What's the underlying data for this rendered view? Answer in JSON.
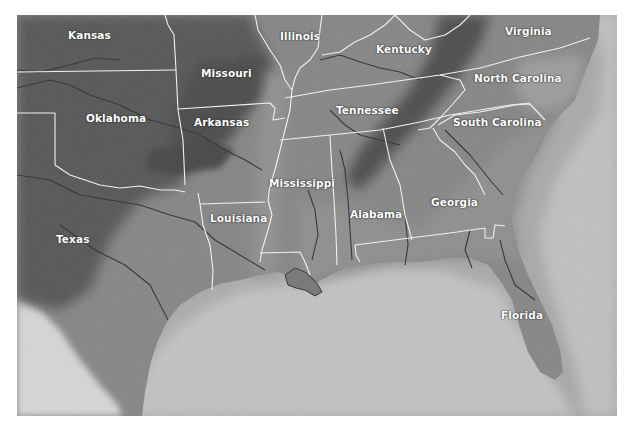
{
  "map": {
    "title": "Southeastern United States relief map",
    "colors": {
      "background": "#ffffff",
      "land_dark": "#4e4e4e",
      "land_mid": "#7a7a7a",
      "land_light": "#8f8f8f",
      "coastal_plain": "#8a8a8a",
      "sea": "#a9a9a9",
      "sea_shelf": "#c4c4c4",
      "mexico_light": "#d8d8d8",
      "border": "#f2f2f2",
      "river": "#3f3f3f",
      "label": "#ffffff"
    },
    "labels": [
      {
        "id": "kansas",
        "text": "Kansas",
        "x": 68,
        "y": 30
      },
      {
        "id": "missouri",
        "text": "Missouri",
        "x": 201,
        "y": 68
      },
      {
        "id": "illinois",
        "text": "Illinois",
        "x": 280,
        "y": 31
      },
      {
        "id": "kentucky",
        "text": "Kentucky",
        "x": 376,
        "y": 44
      },
      {
        "id": "virginia",
        "text": "Virginia",
        "x": 505,
        "y": 26
      },
      {
        "id": "north-carolina",
        "text": "North Carolina",
        "x": 474,
        "y": 73
      },
      {
        "id": "oklahoma",
        "text": "Oklahoma",
        "x": 86,
        "y": 113
      },
      {
        "id": "arkansas",
        "text": "Arkansas",
        "x": 194,
        "y": 117
      },
      {
        "id": "tennessee",
        "text": "Tennessee",
        "x": 336,
        "y": 105
      },
      {
        "id": "south-carolina",
        "text": "South Carolina",
        "x": 453,
        "y": 117
      },
      {
        "id": "mississippi",
        "text": "Mississippi",
        "x": 269,
        "y": 178
      },
      {
        "id": "alabama",
        "text": "Alabama",
        "x": 350,
        "y": 209
      },
      {
        "id": "georgia",
        "text": "Georgia",
        "x": 431,
        "y": 197
      },
      {
        "id": "louisiana",
        "text": "Louisiana",
        "x": 210,
        "y": 213
      },
      {
        "id": "texas",
        "text": "Texas",
        "x": 56,
        "y": 234
      },
      {
        "id": "florida",
        "text": "Florida",
        "x": 501,
        "y": 310
      }
    ]
  }
}
